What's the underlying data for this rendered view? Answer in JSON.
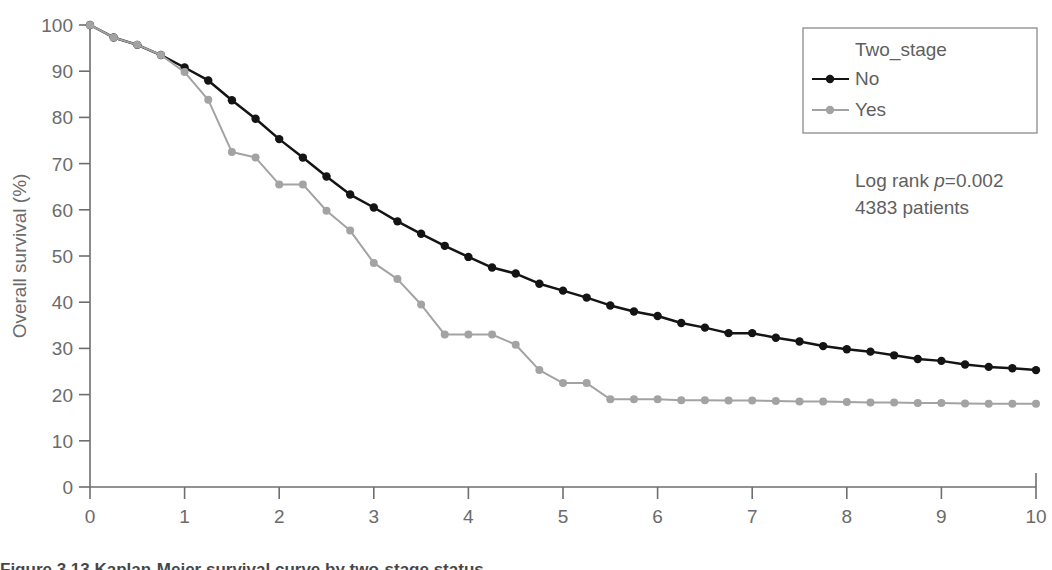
{
  "chart_data": {
    "type": "line",
    "title": "",
    "xlabel": "Year",
    "ylabel": "Overall survival (%)",
    "xlim": [
      0,
      10
    ],
    "ylim": [
      0,
      100
    ],
    "xticks": [
      0,
      1,
      2,
      3,
      4,
      5,
      6,
      7,
      8,
      9,
      10
    ],
    "yticks": [
      0,
      10,
      20,
      30,
      40,
      50,
      60,
      70,
      80,
      90,
      100
    ],
    "grid": false,
    "legend_title": "Two_stage",
    "legend_position": "top-right",
    "markers": true,
    "annotations": [
      {
        "text_prefix": "Log rank ",
        "text_em": "p",
        "text_suffix": "=0.002"
      },
      {
        "text": "4383 patients"
      }
    ],
    "series": [
      {
        "name": "No",
        "color": "#141414",
        "x": [
          0,
          0.25,
          0.5,
          0.75,
          1.0,
          1.25,
          1.5,
          1.75,
          2.0,
          2.25,
          2.5,
          2.75,
          3.0,
          3.25,
          3.5,
          3.75,
          4.0,
          4.25,
          4.5,
          4.75,
          5.0,
          5.25,
          5.5,
          5.75,
          6.0,
          6.25,
          6.5,
          6.75,
          7.0,
          7.25,
          7.5,
          7.75,
          8.0,
          8.25,
          8.5,
          8.75,
          9.0,
          9.25,
          9.5,
          9.75,
          10.0
        ],
        "values": [
          100,
          97.3,
          95.7,
          93.5,
          90.8,
          88.0,
          83.7,
          79.7,
          75.3,
          71.3,
          67.2,
          63.3,
          60.5,
          57.5,
          54.8,
          52.2,
          49.8,
          47.5,
          46.2,
          44.0,
          42.5,
          41.0,
          39.3,
          38.0,
          37.0,
          35.5,
          34.5,
          33.3,
          33.3,
          32.3,
          31.5,
          30.5,
          29.8,
          29.3,
          28.5,
          27.7,
          27.3,
          26.5,
          26.0,
          25.7,
          25.3
        ]
      },
      {
        "name": "Yes",
        "color": "#a3a3a3",
        "x": [
          0,
          0.25,
          0.5,
          0.75,
          1.0,
          1.25,
          1.5,
          1.75,
          2.0,
          2.25,
          2.5,
          2.75,
          3.0,
          3.25,
          3.5,
          3.75,
          4.0,
          4.25,
          4.5,
          4.75,
          5.0,
          5.25,
          5.5,
          5.75,
          6.0,
          6.25,
          6.5,
          6.75,
          7.0,
          7.25,
          7.5,
          7.75,
          8.0,
          8.25,
          8.5,
          8.75,
          9.0,
          9.25,
          9.5,
          9.75,
          10.0
        ],
        "values": [
          100,
          97.3,
          95.7,
          93.5,
          89.8,
          83.8,
          72.5,
          71.3,
          65.5,
          65.5,
          59.8,
          55.5,
          48.5,
          45.0,
          39.5,
          33.0,
          33.0,
          33.0,
          30.8,
          25.3,
          22.5,
          22.5,
          19.0,
          19.0,
          19.0,
          18.8,
          18.8,
          18.7,
          18.7,
          18.6,
          18.5,
          18.5,
          18.4,
          18.3,
          18.3,
          18.2,
          18.2,
          18.1,
          18.0,
          18.0,
          18.0
        ]
      }
    ]
  },
  "caption": {
    "sliver_text": "Figure 3.13   Kaplan-Meier survival curve by two-stage status"
  }
}
